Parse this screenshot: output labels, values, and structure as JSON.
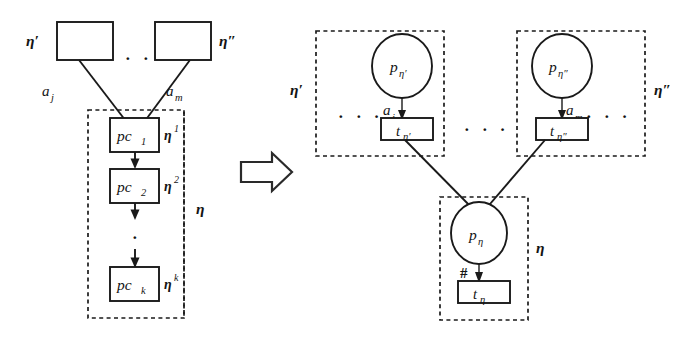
{
  "figure": {
    "transform_arrow": "block-arrow-right"
  },
  "left_diagram": {
    "caption": "source control-flow fragment",
    "top_boxes": [
      {
        "id": "eta-prime-box",
        "label": "",
        "outer_label": "η′"
      },
      {
        "id": "eta-dprime-box",
        "label": "",
        "outer_label": "η″"
      }
    ],
    "ellipsis_top": "· · ·",
    "incoming_arcs": [
      {
        "label_base": "a",
        "label_sub": "j"
      },
      {
        "label_base": "a",
        "label_sub": "m"
      }
    ],
    "group_label": "η",
    "nodes": [
      {
        "base": "pc",
        "sub": "1",
        "side_label_base": "η",
        "side_label_sup": "1"
      },
      {
        "base": "pc",
        "sub": "2",
        "side_label_base": "η",
        "side_label_sup": "2"
      },
      {
        "base": "pc",
        "sub": "k",
        "side_label_base": "η",
        "side_label_sup": "k"
      }
    ],
    "vertical_ellipsis": "·"
  },
  "right_diagram": {
    "caption": "resulting Petri net",
    "groups": [
      {
        "id": "group-eta-prime",
        "outer_label": "η′",
        "outer_label_side": "left",
        "leading_dots": "· · ·",
        "trailing_dots": "",
        "place": {
          "base": "p",
          "sub": "η′"
        },
        "arc_label_base": "a",
        "arc_label_sub": "j",
        "transition": {
          "base": "t",
          "sub": "η′"
        }
      },
      {
        "id": "group-eta-dprime",
        "outer_label": "η″",
        "outer_label_side": "right",
        "leading_dots": "",
        "trailing_dots": "· · ·",
        "place": {
          "base": "p",
          "sub": "η″"
        },
        "arc_label_base": "a",
        "arc_label_sub": "m",
        "transition": {
          "base": "t",
          "sub": "η″"
        }
      }
    ],
    "middle_dots": "· · ·",
    "bottom_group": {
      "id": "group-eta",
      "outer_label": "η",
      "outer_label_side": "right",
      "place": {
        "base": "p",
        "sub": "η"
      },
      "arc_label": "#",
      "transition": {
        "base": "t",
        "sub": "η"
      }
    }
  },
  "colors": {
    "ink": "#1a1a1a",
    "paper": "#ffffff"
  }
}
